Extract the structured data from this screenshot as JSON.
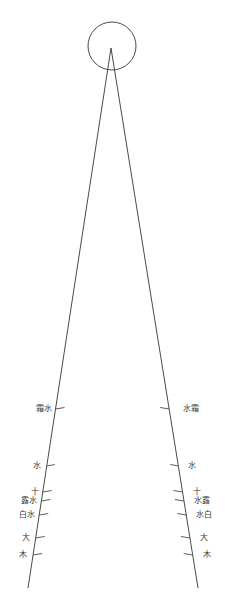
{
  "figure": {
    "title": "",
    "background_color": "#ffffff",
    "stroke_color": "#4a4a4a",
    "label_color": "#3a3a3a",
    "width": 225,
    "height": 614,
    "top_artifact_text": "· ·· ·· ···· ··"
  },
  "circle": {
    "name": "head-circle",
    "center_x": 112,
    "center_y": 46,
    "radius": 24,
    "stroke_width": 1,
    "fill": "none"
  },
  "wedge": {
    "name": "wedge-lines",
    "apex_x": 111,
    "apex_y": 48,
    "left_end_x": 28,
    "left_end_y": 588,
    "right_end_x": 198,
    "right_end_y": 588,
    "stroke_width": 1
  },
  "left_scale": {
    "name": "left-graduation-line",
    "ticks": [
      {
        "y": 409,
        "length": 9,
        "label": "霜水",
        "label_dx": -20,
        "label_dy": 2
      },
      {
        "y": 466,
        "length": 8,
        "label": "水",
        "label_dx": -14,
        "label_dy": 2
      },
      {
        "y": 492,
        "length": 9,
        "label": "十",
        "label_dx": -12,
        "label_dy": 2
      },
      {
        "y": 501,
        "length": 9,
        "label": "露水",
        "label_dx": -20,
        "label_dy": 2
      },
      {
        "y": 515,
        "length": 9,
        "label": "白水",
        "label_dx": -20,
        "label_dy": 2
      },
      {
        "y": 538,
        "length": 9,
        "label": "大",
        "label_dx": -14,
        "label_dy": 2
      },
      {
        "y": 555,
        "length": 9,
        "label": "木",
        "label_dx": -14,
        "label_dy": 2
      }
    ]
  },
  "right_scale": {
    "name": "right-graduation-line",
    "ticks": [
      {
        "y": 409,
        "length": 9,
        "label": "水霜",
        "label_dx": 14,
        "label_dy": 2
      },
      {
        "y": 466,
        "length": 8,
        "label": "水",
        "label_dx": 10,
        "label_dy": 2
      },
      {
        "y": 492,
        "length": 9,
        "label": "十",
        "label_dx": 10,
        "label_dy": 2
      },
      {
        "y": 501,
        "length": 9,
        "label": "水露",
        "label_dx": 10,
        "label_dy": 2
      },
      {
        "y": 515,
        "length": 9,
        "label": "水白",
        "label_dx": 10,
        "label_dy": 2
      },
      {
        "y": 538,
        "length": 9,
        "label": "大",
        "label_dx": 10,
        "label_dy": 2
      },
      {
        "y": 555,
        "length": 9,
        "label": "木",
        "label_dx": 10,
        "label_dy": 2
      }
    ]
  }
}
